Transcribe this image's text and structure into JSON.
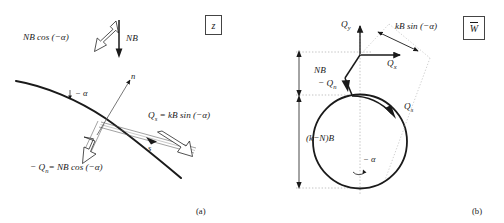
{
  "figure": {
    "panel_a_caption": "(a)",
    "panel_b_caption": "(b)",
    "box_label_a": "z",
    "box_label_b": "W"
  },
  "panel_a": {
    "label_nb_cos": "NB cos (−α)",
    "label_nb": "NB",
    "label_alpha": "− α",
    "label_n_axis": "n",
    "label_s_axis": "s",
    "label_qs": "Q",
    "label_qs_sub": "s",
    "label_qs_rhs": "= kB sin (−α)",
    "label_qn": "− Q",
    "label_qn_sub": "n",
    "label_qn_rhs": "= NB cos (−α)"
  },
  "panel_b": {
    "label_qy": "Q",
    "label_qy_sub": "y",
    "label_qx": "Q",
    "label_qx_sub": "x",
    "label_kb_sin": "kB sin (−α)",
    "label_nb": "NB",
    "label_knb": "(k−N)B",
    "label_minus_qn": "− Q",
    "label_minus_qn_sub": "n",
    "label_qs": "Q",
    "label_qs_sub": "s",
    "label_alpha": "− α"
  },
  "colors": {
    "ink": "#1a1a1a",
    "thin": "#555555",
    "dotted": "#999999",
    "background": "#ffffff"
  }
}
